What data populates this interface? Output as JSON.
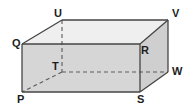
{
  "figure": {
    "name": "cuboid-diagram",
    "type": "3d-rectangular-prism",
    "background_color": "#ffffff",
    "stroke_color": "#444444",
    "hidden_edge_color": "#555555",
    "face_colors": {
      "front": "#d6d6d6",
      "top": "#efefef",
      "right": "#cfcfcf"
    },
    "vertices": [
      {
        "label": "U",
        "x": 62,
        "y": 20,
        "label_x": 54,
        "label_y": 8,
        "hidden": false
      },
      {
        "label": "V",
        "x": 168,
        "y": 20,
        "label_x": 172,
        "label_y": 8,
        "hidden": false
      },
      {
        "label": "Q",
        "x": 22,
        "y": 44,
        "label_x": 12,
        "label_y": 38,
        "hidden": false
      },
      {
        "label": "R",
        "x": 140,
        "y": 44,
        "label_x": 141,
        "label_y": 45,
        "hidden": false
      },
      {
        "label": "T",
        "x": 62,
        "y": 72,
        "label_x": 52,
        "label_y": 61,
        "hidden": true
      },
      {
        "label": "W",
        "x": 168,
        "y": 72,
        "label_x": 172,
        "label_y": 66,
        "hidden": false
      },
      {
        "label": "P",
        "x": 22,
        "y": 92,
        "label_x": 17,
        "label_y": 94,
        "hidden": false
      },
      {
        "label": "S",
        "x": 140,
        "y": 92,
        "label_x": 137,
        "label_y": 94,
        "hidden": false
      }
    ],
    "edges": [
      {
        "name": "edge-Q-R",
        "from": "Q",
        "to": "R",
        "style": "solid"
      },
      {
        "name": "edge-R-S",
        "from": "R",
        "to": "S",
        "style": "solid"
      },
      {
        "name": "edge-S-P",
        "from": "S",
        "to": "P",
        "style": "solid"
      },
      {
        "name": "edge-P-Q",
        "from": "P",
        "to": "Q",
        "style": "solid"
      },
      {
        "name": "edge-U-V",
        "from": "U",
        "to": "V",
        "style": "solid"
      },
      {
        "name": "edge-V-W",
        "from": "V",
        "to": "W",
        "style": "solid"
      },
      {
        "name": "edge-Q-U",
        "from": "Q",
        "to": "U",
        "style": "solid"
      },
      {
        "name": "edge-R-V",
        "from": "R",
        "to": "V",
        "style": "solid"
      },
      {
        "name": "edge-S-W",
        "from": "S",
        "to": "W",
        "style": "solid"
      },
      {
        "name": "edge-U-T",
        "from": "U",
        "to": "T",
        "style": "dashed"
      },
      {
        "name": "edge-T-W",
        "from": "T",
        "to": "W",
        "style": "dashed"
      },
      {
        "name": "edge-T-P",
        "from": "T",
        "to": "P",
        "style": "dashed"
      }
    ],
    "faces": [
      {
        "name": "face-front-PQRS",
        "points": "22,44 140,44 140,92 22,92",
        "fill_key": "front"
      },
      {
        "name": "face-top-QUVR",
        "points": "22,44 62,20 168,20 140,44",
        "fill_key": "top"
      },
      {
        "name": "face-right-RVWS",
        "points": "140,44 168,20 168,72 140,92",
        "fill_key": "right"
      }
    ]
  },
  "labels": {
    "U": "U",
    "V": "V",
    "Q": "Q",
    "R": "R",
    "T": "T",
    "W": "W",
    "P": "P",
    "S": "S"
  }
}
